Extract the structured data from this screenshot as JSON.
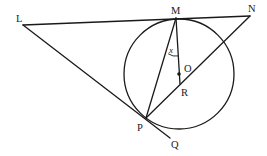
{
  "figure": {
    "type": "geometry-diagram",
    "points": {
      "L": "L",
      "M": "M",
      "N": "N",
      "O": "O",
      "R": "R",
      "P": "P",
      "Q": "Q"
    },
    "angle_label": "x",
    "angle_vertex": "M",
    "angle_between": [
      "MP",
      "MR"
    ],
    "segments": [
      "LM",
      "MN",
      "LP",
      "PQ",
      "MP",
      "MR",
      "PN"
    ],
    "circle_center": "O",
    "colors": {
      "stroke": "#1a1a1a",
      "background": "#ffffff"
    }
  }
}
